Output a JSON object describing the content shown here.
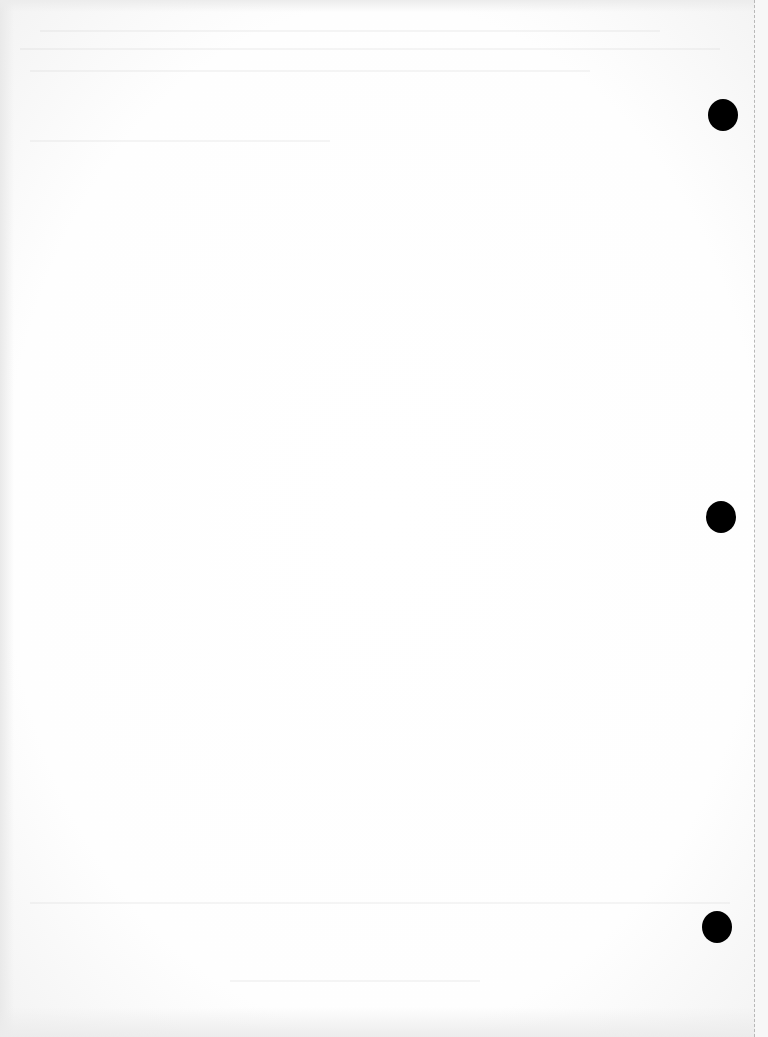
{
  "document": {
    "type": "blank scanned page",
    "text": "",
    "colors": {
      "paper": "#ffffff",
      "punch_hole": "#000000",
      "perforation": "#b8b8b8"
    },
    "punch_holes": [
      {
        "cx": 723,
        "cy": 115,
        "diameter": 30
      },
      {
        "cx": 721,
        "cy": 517,
        "diameter": 30
      },
      {
        "cx": 717,
        "cy": 927,
        "diameter": 30
      }
    ]
  }
}
